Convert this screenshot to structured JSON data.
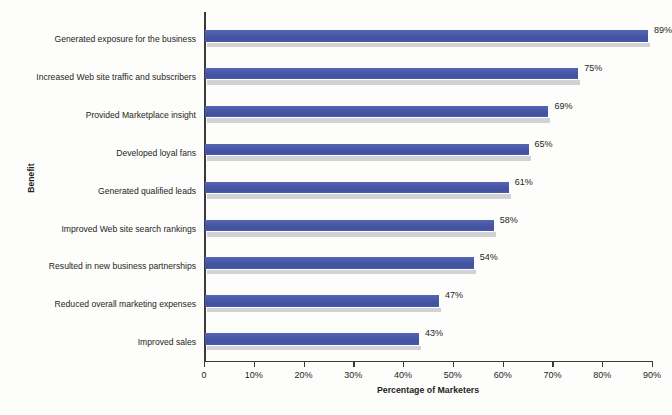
{
  "chart_data": {
    "type": "bar",
    "orientation": "horizontal",
    "title": "",
    "xlabel": "Percentage of Marketers",
    "ylabel": "Benefit",
    "xlim": [
      0,
      90
    ],
    "xticks": [
      0,
      10,
      20,
      30,
      40,
      50,
      60,
      70,
      80,
      90
    ],
    "xtick_labels": [
      "0",
      "10%",
      "20%",
      "30%",
      "40%",
      "50%",
      "60%",
      "70%",
      "80%",
      "90%"
    ],
    "grid": false,
    "legend": null,
    "bar_color": "#4a5aa8",
    "shadow_color": "#d2d2d4",
    "axis_color": "#3a3a3a",
    "categories": [
      "Generated exposure for the business",
      "Increased Web site traffic and subscribers",
      "Provided Marketplace insight",
      "Developed loyal fans",
      "Generated qualified leads",
      "Improved Web site search rankings",
      "Resulted in new business partnerships",
      "Reduced overall marketing expenses",
      "Improved sales"
    ],
    "values": [
      89,
      75,
      69,
      65,
      61,
      58,
      54,
      47,
      43
    ],
    "value_labels": [
      "89%",
      "75%",
      "69%",
      "65%",
      "61%",
      "58%",
      "54%",
      "47%",
      "43%"
    ]
  }
}
